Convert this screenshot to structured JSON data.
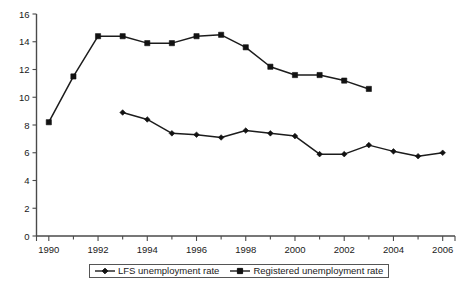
{
  "chart_data": {
    "type": "line",
    "title": "",
    "subtitle": "",
    "xlabel": "",
    "ylabel": "",
    "x": [
      1990,
      1991,
      1992,
      1993,
      1994,
      1995,
      1996,
      1997,
      1998,
      1999,
      2000,
      2001,
      2002,
      2003,
      2004,
      2005,
      2006
    ],
    "xlim": [
      1989.5,
      2006.5
    ],
    "ylim": [
      0,
      16
    ],
    "y_ticks": [
      0,
      2,
      4,
      6,
      8,
      10,
      12,
      14,
      16
    ],
    "x_ticks_major": [
      1990,
      1992,
      1994,
      1996,
      1998,
      2000,
      2002,
      2004,
      2006
    ],
    "x_tick_labels": [
      "1990",
      "1992",
      "1994",
      "1996",
      "1998",
      "2000",
      "2002",
      "2004",
      "2006"
    ],
    "y_tick_labels": [
      "0",
      "2",
      "4",
      "6",
      "8",
      "10",
      "12",
      "14",
      "16"
    ],
    "x_minor_ticks": [
      1991,
      1993,
      1995,
      1997,
      1999,
      2001,
      2003,
      2005
    ],
    "grid": false,
    "legend_position": "bottom",
    "series": [
      {
        "name": "LFS unemployment rate",
        "marker": "diamond",
        "color": "#121212",
        "x": [
          1993,
          1994,
          1995,
          1996,
          1997,
          1998,
          1999,
          2000,
          2001,
          2002,
          2003,
          2004,
          2005,
          2006
        ],
        "values": [
          8.9,
          8.4,
          7.4,
          7.3,
          7.1,
          7.6,
          7.4,
          7.2,
          5.9,
          5.9,
          6.55,
          6.1,
          5.75,
          6.0
        ]
      },
      {
        "name": "Registered unemployment rate",
        "marker": "square",
        "color": "#121212",
        "x": [
          1990,
          1991,
          1992,
          1993,
          1994,
          1995,
          1996,
          1997,
          1998,
          1999,
          2000,
          2001,
          2002,
          2003
        ],
        "values": [
          8.2,
          11.5,
          14.4,
          14.4,
          13.9,
          13.9,
          14.4,
          14.5,
          13.6,
          12.2,
          11.6,
          11.6,
          11.2,
          10.6
        ]
      }
    ]
  },
  "legend": {
    "items": [
      {
        "label": "LFS unemployment rate",
        "marker": "diamond"
      },
      {
        "label": "Registered unemployment rate",
        "marker": "square"
      }
    ]
  }
}
